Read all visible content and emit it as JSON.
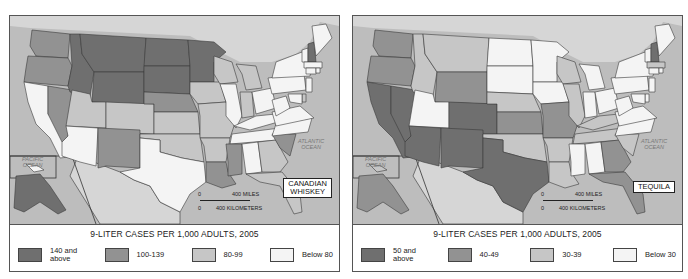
{
  "colors": {
    "class_1_darkest": "#6f6f6f",
    "class_2_dark": "#929292",
    "class_3_light": "#c6c6c6",
    "class_4_lightest": "#f4f4f4",
    "water": "#bdbdbd",
    "border": "#444444"
  },
  "maps": [
    {
      "label": "CANADIAN\nWHISKEY",
      "ocean_pacific": "PACIFIC\nOCEAN",
      "ocean_atlantic": "ATLANTIC\nOCEAN",
      "scale_miles": "400 MILES",
      "scale_km": "400 KILOMETERS",
      "scale_zero": "0",
      "legend": {
        "title": "9-LITER CASES PER 1,000 ADULTS, 2005",
        "items": [
          {
            "label": "140 and\nabove",
            "class": 1
          },
          {
            "label": "100-139",
            "class": 2
          },
          {
            "label": "80-99",
            "class": 3
          },
          {
            "label": "Below 80",
            "class": 4
          }
        ]
      },
      "states": {
        "WA": 2,
        "OR": 2,
        "CA": 4,
        "NV": 2,
        "ID": 1,
        "MT": 1,
        "WY": 1,
        "UT": 3,
        "CO": 3,
        "AZ": 4,
        "NM": 2,
        "ND": 1,
        "SD": 1,
        "NE": 2,
        "KS": 3,
        "OK": 3,
        "TX": 4,
        "MN": 1,
        "IA": 3,
        "MO": 3,
        "AR": 3,
        "LA": 2,
        "WI": 3,
        "IL": 4,
        "MI": 3,
        "IN": 3,
        "OH": 4,
        "KY": 4,
        "TN": 4,
        "MS": 2,
        "AL": 4,
        "GA": 3,
        "FL": 3,
        "SC": 2,
        "NC": 4,
        "VA": 4,
        "WV": 4,
        "PA": 4,
        "NY": 4,
        "VT": 4,
        "NH": 1,
        "ME": 4,
        "MA": 4,
        "CT": 4,
        "RI": 4,
        "NJ": 4,
        "DE": 3,
        "MD": 4,
        "AK": 1,
        "HI": 4
      }
    },
    {
      "label": "TEQUILA",
      "ocean_pacific": "PACIFIC\nOCEAN",
      "ocean_atlantic": "ATLANTIC\nOCEAN",
      "scale_miles": "400 MILES",
      "scale_km": "400 KILOMETERS",
      "scale_zero": "0",
      "legend": {
        "title": "9-LITER CASES PER 1,000 ADULTS, 2005",
        "items": [
          {
            "label": "50 and\nabove",
            "class": 1
          },
          {
            "label": "40-49",
            "class": 2
          },
          {
            "label": "30-39",
            "class": 3
          },
          {
            "label": "Below 30",
            "class": 4
          }
        ]
      },
      "states": {
        "WA": 2,
        "OR": 2,
        "CA": 1,
        "NV": 1,
        "ID": 3,
        "MT": 3,
        "WY": 2,
        "UT": 4,
        "CO": 1,
        "AZ": 1,
        "NM": 1,
        "ND": 4,
        "SD": 4,
        "NE": 3,
        "KS": 2,
        "OK": 3,
        "TX": 1,
        "MN": 4,
        "IA": 4,
        "MO": 2,
        "AR": 3,
        "LA": 3,
        "WI": 3,
        "IL": 3,
        "MI": 4,
        "IN": 4,
        "OH": 4,
        "KY": 3,
        "TN": 3,
        "MS": 4,
        "AL": 4,
        "GA": 2,
        "FL": 2,
        "SC": 3,
        "NC": 4,
        "VA": 4,
        "WV": 4,
        "PA": 4,
        "NY": 4,
        "VT": 4,
        "NH": 1,
        "ME": 4,
        "MA": 3,
        "CT": 4,
        "RI": 4,
        "NJ": 4,
        "DE": 4,
        "MD": 4,
        "AK": 2,
        "HI": 3
      }
    }
  ]
}
